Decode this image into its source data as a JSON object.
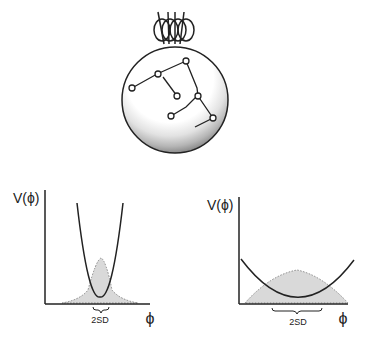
{
  "figure": {
    "top": {
      "description": "Sphere with ball-and-stick molecular chain inside, magnetic-field-like loops above"
    },
    "left_panel": {
      "y_label": "V(ϕ)",
      "x_label": "ϕ",
      "width_label": "2SD",
      "potential": "narrow parabola",
      "distribution": "narrow peaked"
    },
    "right_panel": {
      "y_label": "V(ϕ)",
      "x_label": "ϕ",
      "width_label": "2SD",
      "potential": "wide parabola",
      "distribution": "broad"
    }
  },
  "colors": {
    "line": "#222222",
    "fill": "#d9d9d9",
    "dotted": "#888888"
  }
}
